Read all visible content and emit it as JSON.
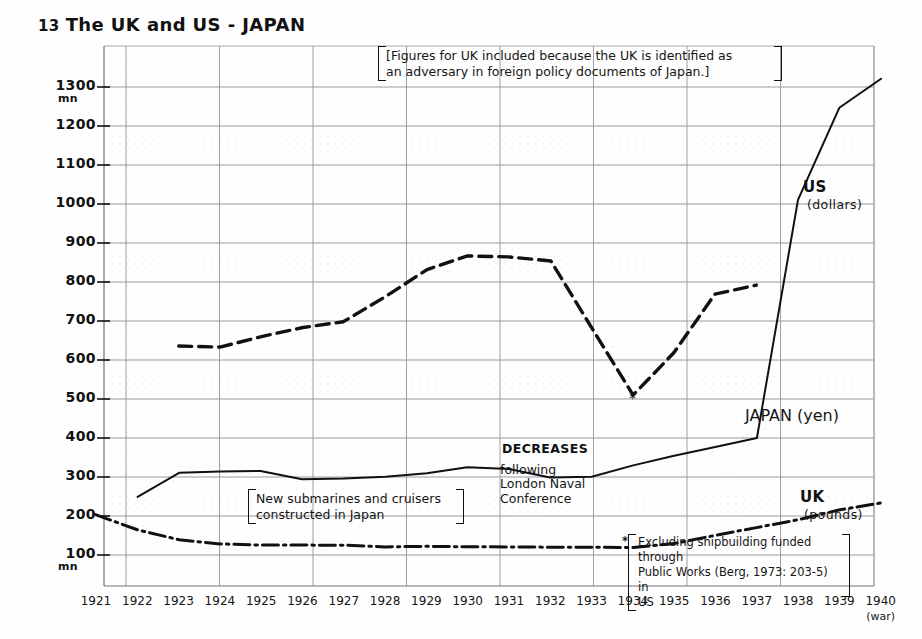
{
  "title": {
    "number": "13",
    "text": "The UK and US - JAPAN"
  },
  "axes": {
    "y_unit_top": "mn",
    "y_unit_bottom": "mn",
    "y_ticks": [
      "1300",
      "1200",
      "1100",
      "1000",
      "900",
      "800",
      "700",
      "600",
      "500",
      "400",
      "300",
      "200",
      "100"
    ],
    "x_ticks": [
      "1921",
      "1922",
      "1923",
      "1924",
      "1925",
      "1926",
      "1927",
      "1928",
      "1929",
      "1930",
      "1931",
      "1932",
      "1933",
      "1934",
      "1935",
      "1936",
      "1937",
      "1938",
      "1939",
      "1940"
    ],
    "x_last_note": "(war)"
  },
  "series_labels": {
    "us": {
      "name": "US",
      "unit": "(dollars)"
    },
    "japan": {
      "name": "JAPAN (yen)"
    },
    "uk": {
      "name": "UK",
      "unit": "(pounds)"
    }
  },
  "annotations": {
    "top_box": "[Figures for UK included because the UK is identified as an adversary in foreign policy documents of Japan.]",
    "top_box_line1": "[Figures for UK included because the UK is identified as",
    "top_box_line2": "an adversary in foreign policy documents of Japan.]",
    "submarines_line1": "New submarines and cruisers",
    "submarines_line2": "constructed in Japan",
    "decreases_heading": "DECREASES",
    "decreases_line1": "following",
    "decreases_line2": "London Naval",
    "decreases_line3": "Conference",
    "footnote_marker": "*",
    "footnote_line1": "Excluding shipbuilding funded through",
    "footnote_line2": "Public Works (Berg, 1973: 203-5) in",
    "footnote_line3": "US"
  },
  "chart_data": {
    "type": "line",
    "xlabel": "",
    "ylabel": "mn",
    "xlim": [
      1921,
      1940
    ],
    "ylim": [
      0,
      1350
    ],
    "grid": true,
    "legend": "inline-right",
    "x": [
      1921,
      1922,
      1923,
      1924,
      1925,
      1926,
      1927,
      1928,
      1929,
      1930,
      1931,
      1932,
      1933,
      1934,
      1935,
      1936,
      1937,
      1938,
      1939,
      1940
    ],
    "series": [
      {
        "name": "US (dollars)",
        "style": "dashed",
        "x": [
          1923,
          1924,
          1925,
          1926,
          1927,
          1928,
          1929,
          1930,
          1931,
          1932,
          1933,
          1934,
          1935,
          1936,
          1937
        ],
        "values": [
          635,
          635,
          660,
          685,
          700,
          760,
          830,
          865,
          865,
          855,
          680,
          510,
          620,
          770,
          790
        ]
      },
      {
        "name": "JAPAN (yen)",
        "style": "solid",
        "x": [
          1922,
          1923,
          1924,
          1925,
          1926,
          1927,
          1928,
          1929,
          1930,
          1931,
          1932,
          1933,
          1934,
          1935,
          1936,
          1937,
          1938,
          1939,
          1940
        ],
        "values": [
          250,
          312,
          315,
          315,
          295,
          295,
          300,
          310,
          325,
          320,
          300,
          300,
          330,
          355,
          375,
          400,
          1010,
          1245,
          1320
        ]
      },
      {
        "name": "UK (pounds)",
        "style": "dash-dot",
        "x": [
          1921,
          1922,
          1923,
          1924,
          1925,
          1926,
          1927,
          1928,
          1929,
          1930,
          1931,
          1932,
          1933,
          1934,
          1935,
          1936,
          1937,
          1938,
          1939,
          1940
        ],
        "values": [
          205,
          165,
          138,
          128,
          126,
          124,
          123,
          122,
          122,
          121,
          120,
          119,
          118,
          120,
          128,
          150,
          170,
          190,
          215,
          235
        ]
      }
    ]
  }
}
